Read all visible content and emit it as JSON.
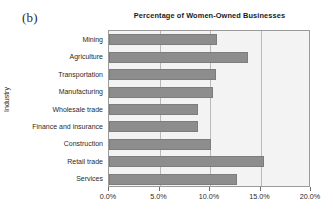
{
  "panel": {
    "label": "(b)"
  },
  "chart_data": {
    "type": "bar",
    "orientation": "horizontal",
    "title": "Percentage of Women-Owned Businesses",
    "xlabel": "",
    "ylabel": "Industry",
    "categories": [
      "Mining",
      "Agriculture",
      "Transportation",
      "Manufacturing",
      "Wholesale trade",
      "Finance and insurance",
      "Construction",
      "Retail trade",
      "Services"
    ],
    "values": [
      10.7,
      13.8,
      10.6,
      10.3,
      8.8,
      8.8,
      10.1,
      15.3,
      12.7
    ],
    "xlim": [
      0,
      20
    ],
    "xticks": [
      0,
      5,
      10,
      15,
      20
    ],
    "xtick_labels": [
      "0.0%",
      "5.0%",
      "10.0%",
      "15.0%",
      "20.0%"
    ],
    "grid": "vertical",
    "legend": "none",
    "bar_color": "#8d8d8d",
    "plot_background": "#f3f3f3",
    "axis_color": "#9a9a9a",
    "gridline_color": "#b9b9b9"
  }
}
